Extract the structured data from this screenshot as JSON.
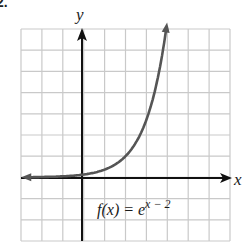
{
  "problem": {
    "number": "2."
  },
  "chart_data": {
    "type": "line",
    "title": "",
    "xlabel": "x",
    "ylabel": "y",
    "xlim": [
      -3,
      7
    ],
    "ylim": [
      -3,
      7
    ],
    "grid": true,
    "grid_step": 1,
    "legend": null,
    "annotations": [
      {
        "text": "f(x) = e^(x − 2)",
        "position": [
          1,
          -1.8
        ]
      }
    ],
    "series": [
      {
        "name": "f(x) = e^(x − 2)",
        "function": "e^(x-2)",
        "x": [
          -3,
          -2,
          -1,
          0,
          1,
          2,
          3,
          3.5,
          3.95
        ],
        "y": [
          0.007,
          0.018,
          0.05,
          0.135,
          0.368,
          1,
          2.718,
          4.48,
          7.03
        ],
        "color": "#555555",
        "left_arrow": true,
        "right_arrow": true
      }
    ]
  },
  "labels": {
    "x_axis": "x",
    "y_axis": "y",
    "func_prefix": "f(x) = e",
    "func_exponent": "x − 2"
  }
}
